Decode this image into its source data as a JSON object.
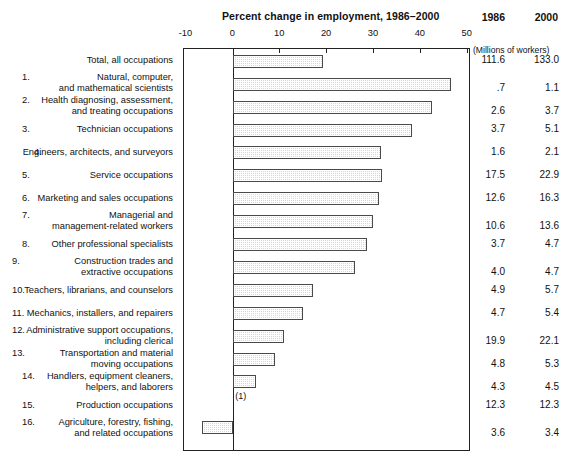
{
  "chart_data": {
    "type": "bar",
    "orientation": "horizontal",
    "title": "Percent change in employment, 1986–2000",
    "xlabel": "",
    "ylabel": "",
    "xlim": [
      -10,
      50
    ],
    "xticks": [
      -10,
      0,
      10,
      20,
      30,
      40,
      50
    ],
    "xticklabels": [
      "-10",
      "0",
      "10",
      "20",
      "30",
      "40",
      "50"
    ],
    "grid": false,
    "legend": null,
    "zero_reference_line": 0,
    "categories": [
      "Total, all occupations",
      "Natural, computer, and mathematical scientists",
      "Health diagnosing, assessment, and treating occupations",
      "Technician occupations",
      "Engineers, architects, and surveyors",
      "Service occupations",
      "Marketing and sales occupations",
      "Managerial and management-related workers",
      "Other professional specialists",
      "Construction trades and extractive occupations",
      "Teachers, librarians, and counselors",
      "Mechanics, installers, and repairers",
      "Administrative support occupations, including clerical",
      "Transportation and material moving occupations",
      "Handlers, equipment cleaners, helpers, and laborers",
      "Production occupations",
      "Agriculture, forestry, fishing, and related occupations"
    ],
    "values": [
      19.2,
      46.4,
      42.3,
      38.2,
      31.6,
      31.7,
      31.0,
      29.9,
      28.5,
      26.0,
      17.0,
      14.9,
      10.8,
      9.0,
      4.8,
      0.0,
      -6.7
    ],
    "annotations": [
      {
        "text": "(1)",
        "row": "Production occupations",
        "meaning": "no change / less than 0.05 percent"
      }
    ],
    "side_table": {
      "headers": [
        "1986",
        "2000"
      ],
      "units_note": "(Millions of workers)",
      "rows": [
        {
          "1986": "111.6",
          "2000": "133.0"
        },
        {
          "1986": ".7",
          "2000": "1.1"
        },
        {
          "1986": "2.6",
          "2000": "3.7"
        },
        {
          "1986": "3.7",
          "2000": "5.1"
        },
        {
          "1986": "1.6",
          "2000": "2.1"
        },
        {
          "1986": "17.5",
          "2000": "22.9"
        },
        {
          "1986": "12.6",
          "2000": "16.3"
        },
        {
          "1986": "10.6",
          "2000": "13.6"
        },
        {
          "1986": "3.7",
          "2000": "4.7"
        },
        {
          "1986": "4.0",
          "2000": "4.7"
        },
        {
          "1986": "4.9",
          "2000": "5.7"
        },
        {
          "1986": "4.7",
          "2000": "5.4"
        },
        {
          "1986": "19.9",
          "2000": "22.1"
        },
        {
          "1986": "4.8",
          "2000": "5.3"
        },
        {
          "1986": "4.3",
          "2000": "4.5"
        },
        {
          "1986": "12.3",
          "2000": "12.3"
        },
        {
          "1986": "3.6",
          "2000": "3.4"
        }
      ]
    }
  },
  "header": {
    "title": "Percent change in employment, 1986–2000",
    "col_1986": "1986",
    "col_2000": "2000",
    "units_note": "(Millions of workers)"
  },
  "axis": {
    "ticks": [
      "-10",
      "0",
      "10",
      "20",
      "30",
      "40",
      "50"
    ]
  },
  "rows": [
    {
      "num": "",
      "label": "Total, all occupations",
      "v1986": "111.6",
      "v2000": "133.0",
      "pct": 19.2
    },
    {
      "num": "1.",
      "label": "Natural, computer,\nand mathematical scientists",
      "v1986": ".7",
      "v2000": "1.1",
      "pct": 46.4
    },
    {
      "num": "2.",
      "label": "Health diagnosing, assessment,\nand treating occupations",
      "v1986": "2.6",
      "v2000": "3.7",
      "pct": 42.3
    },
    {
      "num": "3.",
      "label": "Technician occupations",
      "v1986": "3.7",
      "v2000": "5.1",
      "pct": 38.2
    },
    {
      "num": "4.",
      "label": "Engineers, architects, and surveyors",
      "v1986": "1.6",
      "v2000": "2.1",
      "pct": 31.6
    },
    {
      "num": "5.",
      "label": "Service occupations",
      "v1986": "17.5",
      "v2000": "22.9",
      "pct": 31.7
    },
    {
      "num": "6.",
      "label": "Marketing and sales occupations",
      "v1986": "12.6",
      "v2000": "16.3",
      "pct": 31.0
    },
    {
      "num": "7.",
      "label": "Managerial and\nmanagement-related workers",
      "v1986": "10.6",
      "v2000": "13.6",
      "pct": 29.9
    },
    {
      "num": "8.",
      "label": "Other professional specialists",
      "v1986": "3.7",
      "v2000": "4.7",
      "pct": 28.5
    },
    {
      "num": "9.",
      "label": "Construction trades and\nextractive occupations",
      "v1986": "4.0",
      "v2000": "4.7",
      "pct": 26.0
    },
    {
      "num": "10.",
      "label": "Teachers, librarians, and counselors",
      "v1986": "4.9",
      "v2000": "5.7",
      "pct": 17.0
    },
    {
      "num": "11.",
      "label": "Mechanics, installers, and repairers",
      "v1986": "4.7",
      "v2000": "5.4",
      "pct": 14.9
    },
    {
      "num": "12.",
      "label": "Administrative support occupations,\nincluding clerical",
      "v1986": "19.9",
      "v2000": "22.1",
      "pct": 10.8
    },
    {
      "num": "13.",
      "label": "Transportation and material\nmoving occupations",
      "v1986": "4.8",
      "v2000": "5.3",
      "pct": 9.0
    },
    {
      "num": "14.",
      "label": "Handlers, equipment cleaners,\nhelpers, and laborers",
      "v1986": "4.3",
      "v2000": "4.5",
      "pct": 4.8
    },
    {
      "num": "15.",
      "label": "Production occupations",
      "v1986": "12.3",
      "v2000": "12.3",
      "pct": 0.0
    },
    {
      "num": "16.",
      "label": "Agriculture, forestry, fishing,\nand related occupations",
      "v1986": "3.6",
      "v2000": "3.4",
      "pct": -6.7
    }
  ],
  "footnote": {
    "mark": "(1)"
  }
}
